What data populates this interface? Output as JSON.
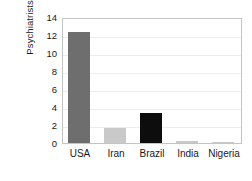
{
  "chart_data": {
    "type": "bar",
    "title": "",
    "subtitle": "",
    "xlabel": "",
    "ylabel": "Psychiatrists per 100,000 people",
    "ylabel_lines": [
      "Psychiatrists",
      "per 100,000 people"
    ],
    "categories": [
      "USA",
      "Iran",
      "Brazil",
      "India",
      "Nigeria"
    ],
    "values": [
      12.3,
      1.7,
      3.3,
      0.2,
      0.05
    ],
    "bar_colors": [
      "#6e6e6e",
      "#c9c9c9",
      "#0d0d0d",
      "#c9c9c9",
      "#c9c9c9"
    ],
    "ylim": [
      0,
      14
    ],
    "ytick_step": 2,
    "yticks": [
      0,
      2,
      4,
      6,
      8,
      10,
      12,
      14
    ],
    "ytick_labels": [
      "0",
      "2",
      "4",
      "6",
      "8",
      "10",
      "12",
      "14"
    ],
    "grid": true,
    "grid_axis": "y",
    "legend": false,
    "legend_position": "none",
    "frame": true,
    "background_color": "#ffffff",
    "axis_color": "#c4c4c4",
    "grid_color": "#ededed",
    "text_color": "#1a1a1a"
  }
}
